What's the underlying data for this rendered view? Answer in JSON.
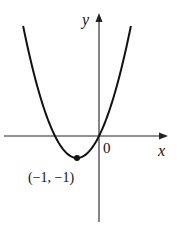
{
  "chart_data": {
    "type": "line",
    "title": "",
    "function": "y = x^2 + 2x",
    "xlabel": "x",
    "ylabel": "y",
    "origin_label": "0",
    "annotations": [
      {
        "label": "(−1, −1)",
        "x": -1,
        "y": -1,
        "marker": "dot"
      }
    ],
    "x": [
      -3.45,
      -3,
      -2.5,
      -2,
      -1.5,
      -1,
      -0.5,
      0,
      0.5,
      1,
      1.45
    ],
    "series": [
      {
        "name": "parabola",
        "values": [
          5.0,
          3,
          1.25,
          0,
          -0.75,
          -1,
          -0.75,
          0,
          1.25,
          3,
          5.0
        ]
      }
    ],
    "grid": false
  },
  "labels": {
    "y_axis": "y",
    "x_axis": "x",
    "origin": "0",
    "vertex": "(−1, −1)"
  }
}
